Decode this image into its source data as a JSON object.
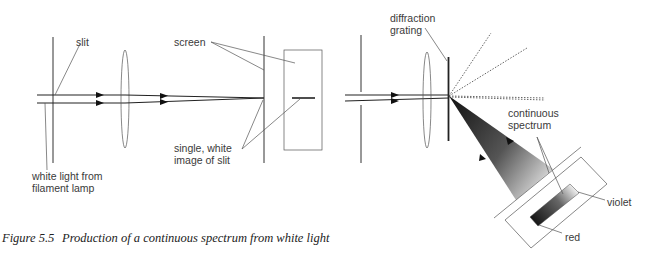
{
  "figure": {
    "caption_number": "Figure 5.5",
    "caption_text": "Production of a continuous spectrum from white light"
  },
  "left_diagram": {
    "labels": {
      "slit": "slit",
      "source_line1": "white light from",
      "source_line2": "filament lamp",
      "screen": "screen",
      "image_line1": "single, white",
      "image_line2": "image of slit"
    }
  },
  "right_diagram": {
    "labels": {
      "grating_line1": "diffraction",
      "grating_line2": "grating",
      "spectrum_line1": "continuous",
      "spectrum_line2": "spectrum",
      "violet": "violet",
      "red": "red"
    }
  },
  "colors": {
    "background": "#ffffff",
    "ink": "#222222",
    "spectrum_dark": "#1a1a1a",
    "spectrum_light": "#f0f0f0"
  }
}
